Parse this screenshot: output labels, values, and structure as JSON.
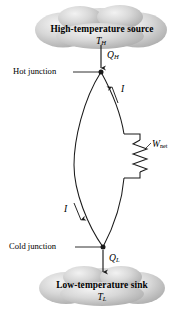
{
  "figure": {
    "kind": "thermoelectric-power-generator-circuit",
    "background_color": "#ffffff",
    "line_color": "#1a1a1a",
    "cloud_fill": "#c9c9c9"
  },
  "source_cloud": {
    "label": "High-temperature source",
    "temperature_symbol": "T",
    "temperature_subscript": "H"
  },
  "sink_cloud": {
    "label": "Low-temperature sink",
    "temperature_symbol": "T",
    "temperature_subscript": "L"
  },
  "heat_in": {
    "symbol": "Q",
    "subscript": "H",
    "direction": "down"
  },
  "heat_out": {
    "symbol": "Q",
    "subscript": "L",
    "direction": "down"
  },
  "junctions": {
    "hot_label": "Hot junction",
    "cold_label": "Cold junction"
  },
  "current": {
    "symbol_right": "I",
    "symbol_left": "I"
  },
  "work": {
    "symbol": "W",
    "subscript": "net"
  }
}
